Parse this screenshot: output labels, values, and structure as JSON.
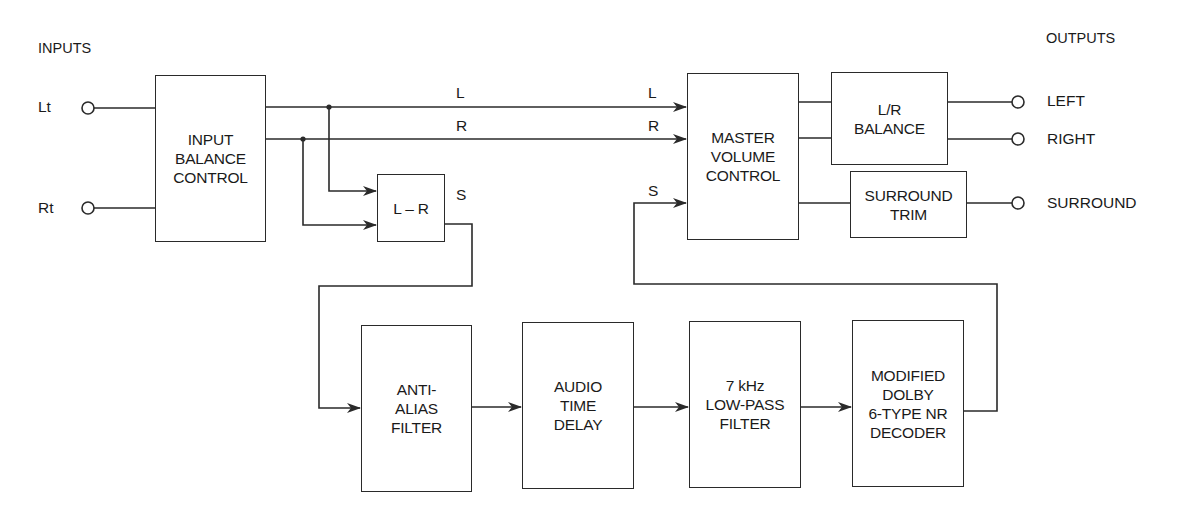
{
  "headers": {
    "inputs": "INPUTS",
    "outputs": "OUTPUTS"
  },
  "inputs": [
    {
      "id": "lt",
      "label": "Lt"
    },
    {
      "id": "rt",
      "label": "Rt"
    }
  ],
  "outputs": [
    {
      "id": "left",
      "label": "LEFT"
    },
    {
      "id": "right",
      "label": "RIGHT"
    },
    {
      "id": "surround",
      "label": "SURROUND"
    }
  ],
  "blocks": {
    "input_balance": "INPUT\nBALANCE\nCONTROL",
    "l_minus_r": "L – R",
    "master_volume": "MASTER\nVOLUME\nCONTROL",
    "lr_balance": "L/R\nBALANCE",
    "surround_trim": "SURROUND\nTRIM",
    "anti_alias": "ANTI-\nALIAS\nFILTER",
    "audio_delay": "AUDIO\nTIME\nDELAY",
    "low_pass": "7 kHz\nLOW-PASS\nFILTER",
    "nr_decoder": "MODIFIED\nDOLBY\n6-TYPE NR\nDECODER"
  },
  "signal_labels": {
    "l_mid": "L",
    "l_end": "L",
    "r_mid": "R",
    "r_end": "R",
    "s_out": "S",
    "s_in": "S"
  }
}
